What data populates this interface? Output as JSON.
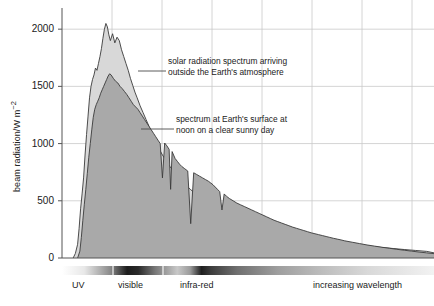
{
  "chart_data": {
    "type": "area",
    "title": "",
    "xlabel": "increasing wavelength",
    "ylabel": "beam radiation/W m⁻²",
    "ylim": [
      0,
      2150
    ],
    "xlim": [
      0,
      100
    ],
    "yticks": [
      0,
      500,
      1000,
      1500,
      2000
    ],
    "ytick_labels": [
      "0",
      "500",
      "1000",
      "1500",
      "2000"
    ],
    "grid": true,
    "legend_position": "annotations-inline",
    "series": [
      {
        "name": "solar radiation spectrum arriving outside the Earth's atmosphere",
        "fill": "#d8d8d8",
        "x": [
          3.0,
          3.6,
          4.2,
          4.6,
          5.0,
          5.4,
          5.8,
          6.2,
          6.6,
          7.0,
          7.4,
          7.8,
          8.2,
          8.6,
          9.0,
          9.4,
          9.8,
          10.2,
          10.6,
          11.0,
          11.4,
          11.8,
          12.2,
          12.6,
          13.0,
          13.6,
          14.2,
          14.8,
          15.4,
          16.0,
          16.6,
          17.2,
          17.8,
          18.4,
          19.0,
          19.6,
          20.2,
          21.0,
          21.8,
          22.6,
          23.4,
          24.2,
          25.0,
          26.0,
          27.0,
          28.0,
          29.0,
          30.0,
          31.0,
          32.0,
          33.0,
          34.5,
          36.0,
          37.5,
          39.0,
          41.0,
          43.0,
          45.0,
          47.0,
          49.0,
          51.0,
          53.0,
          56.0,
          59.0,
          62.0,
          65.0,
          68.0,
          71.0,
          74.0,
          77.0,
          80.0,
          83.0,
          86.0,
          89.0,
          92.0,
          95.0,
          98.0,
          100.0
        ],
        "y": [
          0,
          40,
          120,
          260,
          430,
          560,
          700,
          900,
          1080,
          1240,
          1400,
          1500,
          1560,
          1600,
          1660,
          1640,
          1700,
          1760,
          1830,
          1920,
          2000,
          2050,
          2020,
          1950,
          1900,
          1960,
          1880,
          1930,
          1900,
          1820,
          1760,
          1700,
          1640,
          1570,
          1510,
          1450,
          1400,
          1330,
          1270,
          1210,
          1150,
          1090,
          1030,
          960,
          900,
          850,
          800,
          760,
          720,
          680,
          645,
          600,
          560,
          520,
          490,
          450,
          415,
          380,
          350,
          325,
          300,
          280,
          250,
          225,
          205,
          185,
          168,
          152,
          138,
          125,
          113,
          102,
          92,
          83,
          74,
          66,
          58,
          45
        ]
      },
      {
        "name": "spectrum at Earth's surface at noon on a clear sunny day",
        "fill": "#a9a9a9",
        "x": [
          4.2,
          4.8,
          5.2,
          5.6,
          6.0,
          6.4,
          6.8,
          7.2,
          7.6,
          8.0,
          8.4,
          8.8,
          9.2,
          9.6,
          10.0,
          10.4,
          10.8,
          11.2,
          11.6,
          12.0,
          12.4,
          12.8,
          13.2,
          13.8,
          14.4,
          15.0,
          15.6,
          16.2,
          16.8,
          17.4,
          18.0,
          18.6,
          19.2,
          19.8,
          20.4,
          21.0,
          21.6,
          22.2,
          22.8,
          23.4,
          24.0,
          24.6,
          25.2,
          25.8,
          26.4,
          27.0,
          27.6,
          28.2,
          28.8,
          29.2,
          29.6,
          30.0,
          30.4,
          31.0,
          31.6,
          32.2,
          33.0,
          33.8,
          34.6,
          35.4,
          36.2,
          37.0,
          37.8,
          38.6,
          39.4,
          40.0,
          40.6,
          41.2,
          41.8,
          42.4,
          43.0,
          43.6,
          44.2,
          45.0,
          46.0,
          47.0,
          48.0,
          49.0,
          50.0,
          51.0,
          52.0,
          53.0,
          54.0,
          55.0,
          56.0,
          57.0,
          58.0,
          59.0,
          60.0,
          61.0,
          62.0,
          63.0,
          64.0,
          65.0,
          66.0,
          67.0,
          68.0,
          69.0,
          70.0,
          71.0,
          72.0,
          73.0,
          74.0,
          75.0,
          76.0,
          78.0,
          80.0,
          82.0,
          84.0,
          86.0,
          88.0,
          90.0,
          92.0,
          94.0,
          96.0,
          98.0,
          100.0
        ],
        "y": [
          0,
          60,
          180,
          330,
          470,
          600,
          740,
          880,
          1000,
          1120,
          1230,
          1300,
          1340,
          1370,
          1400,
          1440,
          1470,
          1500,
          1530,
          1560,
          1590,
          1610,
          1600,
          1570,
          1545,
          1530,
          1500,
          1480,
          1455,
          1430,
          1400,
          1370,
          1340,
          1320,
          1300,
          1270,
          1240,
          1210,
          1180,
          1150,
          1120,
          1090,
          1060,
          1030,
          1000,
          700,
          1005,
          980,
          950,
          600,
          930,
          900,
          870,
          845,
          820,
          800,
          780,
          760,
          300,
          745,
          730,
          715,
          700,
          685,
          670,
          655,
          640,
          620,
          600,
          580,
          420,
          560,
          540,
          520,
          500,
          480,
          465,
          450,
          435,
          420,
          405,
          390,
          375,
          360,
          345,
          330,
          318,
          306,
          294,
          282,
          270,
          260,
          250,
          240,
          230,
          220,
          212,
          204,
          196,
          188,
          180,
          172,
          165,
          158,
          150,
          138,
          126,
          114,
          104,
          94,
          85,
          76,
          68,
          60,
          52,
          45,
          38
        ]
      }
    ],
    "annotations": [
      {
        "id": "outer-spectrum-annotation",
        "lines": [
          "solar radiation spectrum arriving",
          "outside the Earth's atmosphere"
        ],
        "text_x": 168,
        "text_y": 56,
        "leader": {
          "x1": 138,
          "y1": 71,
          "x2": 166,
          "y2": 71
        }
      },
      {
        "id": "surface-spectrum-annotation",
        "lines": [
          "spectrum at Earth's surface at",
          "noon on a clear sunny day"
        ],
        "text_x": 176,
        "text_y": 114,
        "leader": {
          "x1": 141,
          "y1": 129,
          "x2": 174,
          "y2": 129
        }
      }
    ],
    "spectrum_bar": {
      "segments": [
        {
          "name": "uv",
          "label": "UV",
          "label_x": 72
        },
        {
          "name": "visible",
          "label": "visible",
          "label_x": 118
        },
        {
          "name": "infra-red",
          "label": "infra-red",
          "label_x": 180
        }
      ],
      "trailing_label": "increasing wavelength",
      "trailing_label_x": 313,
      "divider_positions": [
        113,
        163
      ]
    },
    "colors": {
      "extraterrestrial_fill": "#d8d8d8",
      "surface_fill": "#a9a9a9",
      "curve_stroke": "#3a3a3a",
      "grid": "#c9c9c9",
      "axis": "#555555",
      "text": "#1a1a1a"
    }
  }
}
